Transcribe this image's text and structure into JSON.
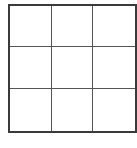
{
  "grid": {
    "rows": 3,
    "cols": 3,
    "cells": [
      [
        "",
        "",
        ""
      ],
      [
        "",
        "",
        ""
      ],
      [
        "",
        "",
        ""
      ]
    ],
    "border_color": "#3a3a3a",
    "line_color": "#555555"
  }
}
